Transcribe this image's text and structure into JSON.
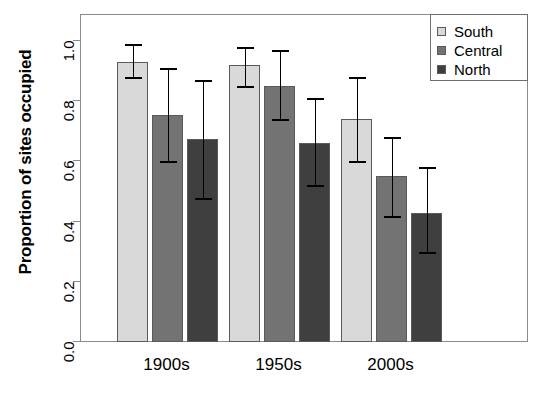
{
  "chart_data": {
    "type": "bar",
    "title": "",
    "xlabel": "",
    "ylabel": "Proportion of sites occupied",
    "categories": [
      "1900s",
      "1950s",
      "2000s"
    ],
    "ylim": [
      0.0,
      1.0
    ],
    "yticks": [
      "0.0",
      "0.2",
      "0.4",
      "0.6",
      "0.8",
      "1.0"
    ],
    "ytick_values": [
      0.0,
      0.2,
      0.4,
      0.6,
      0.8,
      1.0
    ],
    "grid": false,
    "legend_position": "top-right",
    "errorbars": "asymmetric confidence intervals",
    "series": [
      {
        "name": "South",
        "color": "#d9d9d9",
        "values": [
          0.93,
          0.92,
          0.74
        ],
        "err_low": [
          0.88,
          0.85,
          0.6
        ],
        "err_high": [
          0.99,
          0.98,
          0.88
        ]
      },
      {
        "name": "Central",
        "color": "#737373",
        "values": [
          0.755,
          0.85,
          0.55
        ],
        "err_low": [
          0.6,
          0.74,
          0.42
        ],
        "err_high": [
          0.91,
          0.97,
          0.68
        ]
      },
      {
        "name": "North",
        "color": "#3f3f3f",
        "values": [
          0.675,
          0.66,
          0.43
        ],
        "err_low": [
          0.48,
          0.52,
          0.3
        ],
        "err_high": [
          0.87,
          0.81,
          0.58
        ]
      }
    ]
  },
  "legend": {
    "entries": [
      {
        "label": "South",
        "color": "#d9d9d9"
      },
      {
        "label": "Central",
        "color": "#737373"
      },
      {
        "label": "North",
        "color": "#3f3f3f"
      }
    ]
  }
}
